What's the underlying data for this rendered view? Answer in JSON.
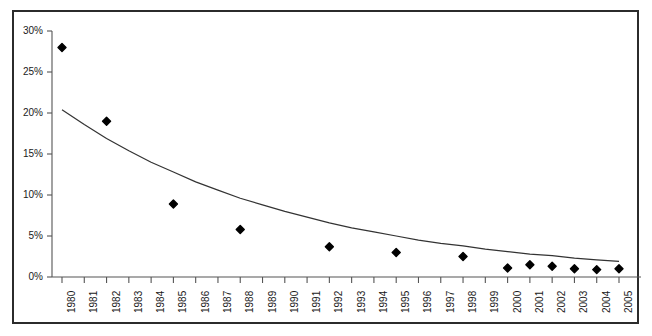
{
  "chart_data": {
    "type": "scatter",
    "title": "",
    "subtitle": "",
    "xlabel": "",
    "ylabel": "",
    "xlim": [
      1979.5,
      2005.7
    ],
    "ylim": [
      0,
      30
    ],
    "grid": false,
    "legend": null,
    "y_tick_labels": [
      "30%",
      "25%",
      "20%",
      "15%",
      "10%",
      "5%",
      "0%"
    ],
    "y_tick_values": [
      30,
      25,
      20,
      15,
      10,
      5,
      0
    ],
    "x_tick_labels": [
      "1980",
      "1981",
      "1982",
      "1983",
      "1984",
      "1985",
      "1986",
      "1987",
      "1988",
      "1989",
      "1990",
      "1991",
      "1992",
      "1993",
      "1994",
      "1995",
      "1996",
      "1997",
      "1998",
      "1999",
      "2000",
      "2001",
      "2002",
      "2003",
      "2004",
      "2005"
    ],
    "x_tick_values": [
      1980,
      1981,
      1982,
      1983,
      1984,
      1985,
      1986,
      1987,
      1988,
      1989,
      1990,
      1991,
      1992,
      1993,
      1994,
      1995,
      1996,
      1997,
      1998,
      1999,
      2000,
      2001,
      2002,
      2003,
      2004,
      2005
    ],
    "series": [
      {
        "name": "observations",
        "type": "scatter",
        "marker": "diamond",
        "color": "#000000",
        "points": [
          {
            "x": 1980,
            "y": 28.0
          },
          {
            "x": 1982,
            "y": 19.0
          },
          {
            "x": 1985,
            "y": 8.9
          },
          {
            "x": 1988,
            "y": 5.8
          },
          {
            "x": 1992,
            "y": 3.7
          },
          {
            "x": 1995,
            "y": 3.0
          },
          {
            "x": 1998,
            "y": 2.5
          },
          {
            "x": 2000,
            "y": 1.1
          },
          {
            "x": 2001,
            "y": 1.5
          },
          {
            "x": 2002,
            "y": 1.3
          },
          {
            "x": 2003,
            "y": 1.0
          },
          {
            "x": 2004,
            "y": 0.9
          },
          {
            "x": 2005,
            "y": 1.0
          }
        ]
      },
      {
        "name": "trend",
        "type": "line",
        "color": "#333333",
        "points": [
          {
            "x": 1980,
            "y": 20.4
          },
          {
            "x": 1981,
            "y": 18.6
          },
          {
            "x": 1982,
            "y": 16.9
          },
          {
            "x": 1983,
            "y": 15.4
          },
          {
            "x": 1984,
            "y": 14.0
          },
          {
            "x": 1985,
            "y": 12.8
          },
          {
            "x": 1986,
            "y": 11.6
          },
          {
            "x": 1987,
            "y": 10.6
          },
          {
            "x": 1988,
            "y": 9.6
          },
          {
            "x": 1989,
            "y": 8.8
          },
          {
            "x": 1990,
            "y": 8.0
          },
          {
            "x": 1991,
            "y": 7.3
          },
          {
            "x": 1992,
            "y": 6.6
          },
          {
            "x": 1993,
            "y": 6.0
          },
          {
            "x": 1994,
            "y": 5.5
          },
          {
            "x": 1995,
            "y": 5.0
          },
          {
            "x": 1996,
            "y": 4.5
          },
          {
            "x": 1997,
            "y": 4.1
          },
          {
            "x": 1998,
            "y": 3.8
          },
          {
            "x": 1999,
            "y": 3.4
          },
          {
            "x": 2000,
            "y": 3.1
          },
          {
            "x": 2001,
            "y": 2.8
          },
          {
            "x": 2002,
            "y": 2.6
          },
          {
            "x": 2003,
            "y": 2.3
          },
          {
            "x": 2004,
            "y": 2.1
          },
          {
            "x": 2005,
            "y": 1.9
          }
        ]
      }
    ],
    "colors": {
      "marker": "#000000",
      "trendline": "#333333",
      "axis": "#555555",
      "frame": "#2b2b2b",
      "background": "#ffffff",
      "text": "#1a1a1a"
    }
  }
}
